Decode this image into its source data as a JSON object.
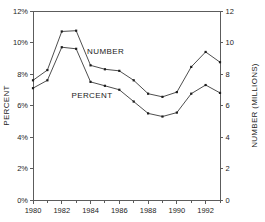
{
  "chart_data": {
    "type": "line",
    "title": "",
    "subtitle": "",
    "xlabel": "",
    "ylabel": "PERCENT",
    "y2label": "NUMBER (MILLIONS)",
    "x": [
      1980,
      1981,
      1982,
      1983,
      1984,
      1985,
      1986,
      1987,
      1988,
      1989,
      1990,
      1991,
      1992,
      1993
    ],
    "xlim": [
      1980,
      1993
    ],
    "ylim": [
      0,
      12
    ],
    "y2lim": [
      0,
      12
    ],
    "grid": false,
    "legend_position": "inline-annotation",
    "x_tick_labels": [
      "1980",
      "1982",
      "1984",
      "1986",
      "1988",
      "1990",
      "1992"
    ],
    "x_tick_values": [
      1980,
      1982,
      1984,
      1986,
      1988,
      1990,
      1992
    ],
    "x_minor_tick_values": [
      1981,
      1983,
      1985,
      1987,
      1989,
      1991,
      1993
    ],
    "y_tick_labels": [
      "0%",
      "2%",
      "4%",
      "6%",
      "8%",
      "10%",
      "12%"
    ],
    "y_tick_values": [
      0,
      2,
      4,
      6,
      8,
      10,
      12
    ],
    "y2_tick_labels": [
      "0",
      "2",
      "4",
      "6",
      "8",
      "10",
      "12"
    ],
    "y2_tick_values": [
      0,
      2,
      4,
      6,
      8,
      10,
      12
    ],
    "series": [
      {
        "name": "NUMBER",
        "axis": "right",
        "units": "millions",
        "annotation": "NUMBER",
        "annotation_x": 1985.05,
        "annotation_y": 9.25,
        "values": [
          7.6,
          8.25,
          10.7,
          10.75,
          8.55,
          8.3,
          8.2,
          7.6,
          6.75,
          6.55,
          6.85,
          8.45,
          9.4,
          8.75
        ]
      },
      {
        "name": "PERCENT",
        "axis": "left",
        "units": "percent",
        "annotation": "PERCENT",
        "annotation_x": 1984.1,
        "annotation_y": 6.45,
        "values": [
          7.1,
          7.6,
          9.7,
          9.6,
          7.5,
          7.25,
          7.0,
          6.25,
          5.5,
          5.3,
          5.55,
          6.75,
          7.3,
          6.8
        ]
      }
    ],
    "colors": {
      "line": "#3a3a3a",
      "marker": "#1d1d1d",
      "axis": "#5c5c5c",
      "text": "#242424",
      "background": "#ffffff"
    },
    "geometry": {
      "plot_left": 33,
      "plot_right": 220,
      "plot_top": 11,
      "plot_bottom": 200
    }
  }
}
